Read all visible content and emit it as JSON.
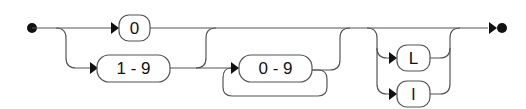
{
  "diagram": {
    "type": "railroad",
    "start_terminal": "start-dot",
    "end_terminal": "end-dot",
    "tokens": {
      "zero": "0",
      "one_to_nine": "1 - 9",
      "zero_to_nine": "0 - 9",
      "suffix_upper_l": "L",
      "suffix_lower_l": "l"
    },
    "colors": {
      "stroke": "#555555",
      "terminal": "#111111",
      "box_fill": "#ffffff"
    }
  }
}
